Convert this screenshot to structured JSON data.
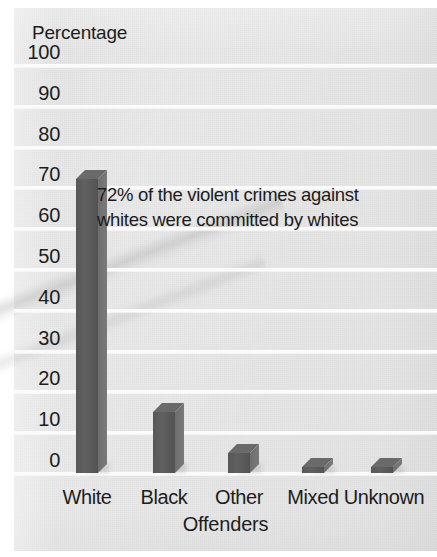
{
  "chart_data": {
    "type": "bar",
    "title": "",
    "categories": [
      "White",
      "Black",
      "Other",
      "Mixed",
      "Unknown"
    ],
    "values": [
      72,
      15,
      5,
      1.5,
      1.5
    ],
    "xlabel": "Offenders",
    "ylabel": "Percentage",
    "ylim": [
      0,
      100
    ],
    "ytick_labels": [
      "100",
      "90",
      "80",
      "70",
      "60",
      "50",
      "40",
      "30",
      "20",
      "10",
      "0"
    ],
    "ytick_values": [
      100,
      90,
      80,
      70,
      60,
      50,
      40,
      30,
      20,
      10,
      0
    ],
    "grid": true,
    "legend": "none",
    "annotations": [
      {
        "text": "72% of the violent crimes against whites were committed by whites",
        "line1": "72% of the violent crimes against",
        "line2": "whites were committed by whites"
      }
    ],
    "bar_color": "#5a5a5a",
    "bar_top_color": "#6a6a6a",
    "bar_side_color": "#757575",
    "background_color": "#e6e6e6",
    "gridline_color": "#fbfbfb"
  }
}
